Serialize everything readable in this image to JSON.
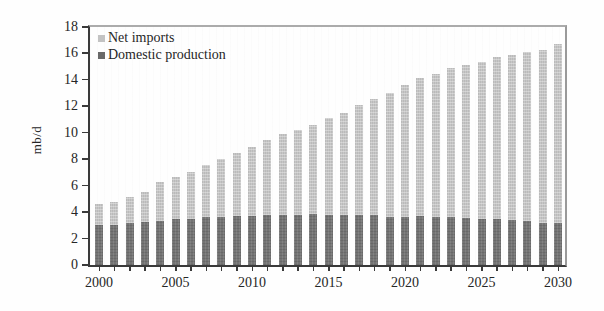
{
  "figure": {
    "kind": "scanned-book-figure",
    "background": "#fefefe"
  },
  "colors": {
    "axis": "#3a3a3a",
    "frame_top_right": "#a5a5a5",
    "net_imports_bar": "#c7c7c7",
    "domestic_production_bar": "#747474",
    "text": "#262626"
  },
  "chart_data": {
    "type": "bar",
    "stacked": true,
    "title": "",
    "xlabel": "",
    "ylabel": "mb/d",
    "ylim": [
      0,
      18
    ],
    "ytick_step": 2,
    "ytick_labels": [
      "0",
      "2",
      "4",
      "6",
      "8",
      "10",
      "12",
      "14",
      "16",
      "18"
    ],
    "grid": false,
    "legend_position": "top-left-inside",
    "years": [
      2000,
      2001,
      2002,
      2003,
      2004,
      2005,
      2006,
      2007,
      2008,
      2009,
      2010,
      2011,
      2012,
      2013,
      2014,
      2015,
      2016,
      2017,
      2018,
      2019,
      2020,
      2021,
      2022,
      2023,
      2024,
      2025,
      2026,
      2027,
      2028,
      2029,
      2030
    ],
    "xtick_labels": [
      "2000",
      "2005",
      "2010",
      "2015",
      "2020",
      "2025",
      "2030"
    ],
    "xtick_label_years": [
      2000,
      2005,
      2010,
      2015,
      2020,
      2025,
      2030
    ],
    "series": [
      {
        "name": "Domestic production",
        "color": "#747474",
        "values": [
          3.0,
          3.05,
          3.2,
          3.25,
          3.35,
          3.45,
          3.45,
          3.65,
          3.65,
          3.7,
          3.7,
          3.75,
          3.8,
          3.8,
          3.85,
          3.8,
          3.8,
          3.8,
          3.8,
          3.65,
          3.65,
          3.7,
          3.65,
          3.6,
          3.55,
          3.5,
          3.45,
          3.4,
          3.3,
          3.2,
          3.15
        ],
        "legend_label": "Domestic production"
      },
      {
        "name": "Net imports",
        "color": "#c7c7c7",
        "values": [
          1.6,
          1.75,
          1.95,
          2.25,
          2.95,
          3.15,
          3.55,
          3.9,
          4.4,
          4.8,
          5.25,
          5.7,
          6.1,
          6.45,
          6.75,
          7.35,
          7.7,
          8.3,
          8.75,
          9.35,
          10.0,
          10.4,
          10.85,
          11.25,
          11.6,
          11.9,
          12.25,
          12.5,
          12.8,
          13.1,
          13.5
        ],
        "legend_label": "Net imports"
      }
    ]
  }
}
